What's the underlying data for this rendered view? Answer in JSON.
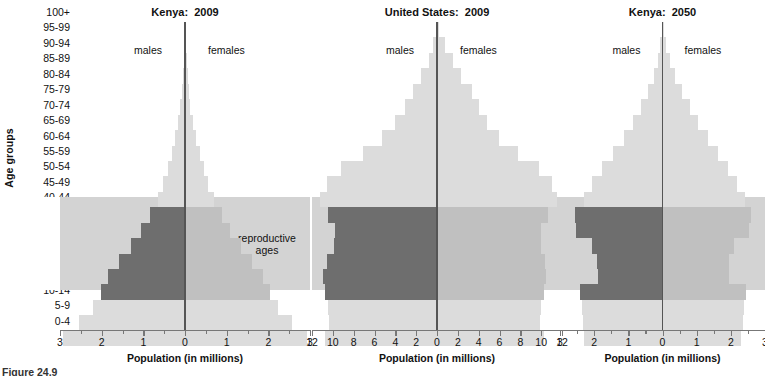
{
  "figure": {
    "caption": "Figure 24.9",
    "y_axis_title": "Age groups",
    "x_axis_title": "Population (in millions)",
    "reproductive_label_line1": "reproductive",
    "reproductive_label_line2": "ages",
    "male_label": "males",
    "female_label": "females",
    "band_color": "#d3d3d3",
    "bar_light_color": "#dcdcdc",
    "bar_mid_color": "#c0c0c0",
    "bar_dark_color": "#6e6e6e",
    "centerline_color": "#555555"
  },
  "age_groups": [
    "100+",
    "95-99",
    "90-94",
    "85-89",
    "80-84",
    "75-79",
    "70-74",
    "65-69",
    "60-64",
    "55-59",
    "50-54",
    "45-49",
    "40-44",
    "35-39",
    "30-34",
    "25-29",
    "20-24",
    "15-19",
    "10-14",
    "5-9",
    "0-4"
  ],
  "reproductive_ages": [
    "15-19",
    "20-24",
    "25-29",
    "30-34",
    "35-39",
    "40-44"
  ],
  "chart_data": [
    {
      "type": "bar",
      "title": "Kenya:  2009",
      "xlabel": "Population (in millions)",
      "ylabel": "Age groups",
      "xlim": [
        -3,
        3
      ],
      "xticks": [
        3,
        2,
        1,
        0,
        1,
        2,
        3
      ],
      "xtick_values": [
        -3,
        -2,
        -1,
        0,
        1,
        2,
        3
      ],
      "minor_tick_step": 0.5,
      "grid": false,
      "categories": [
        "100+",
        "95-99",
        "90-94",
        "85-89",
        "80-84",
        "75-79",
        "70-74",
        "65-69",
        "60-64",
        "55-59",
        "50-54",
        "45-49",
        "40-44",
        "35-39",
        "30-34",
        "25-29",
        "20-24",
        "15-19",
        "10-14",
        "5-9",
        "0-4"
      ],
      "series": [
        {
          "name": "males",
          "values": [
            0.01,
            0.02,
            0.03,
            0.05,
            0.08,
            0.12,
            0.17,
            0.24,
            0.32,
            0.41,
            0.52,
            0.66,
            0.84,
            1.05,
            1.3,
            1.58,
            1.85,
            2.02,
            2.22,
            2.55,
            2.92
          ]
        },
        {
          "name": "females",
          "values": [
            0.01,
            0.02,
            0.04,
            0.06,
            0.09,
            0.13,
            0.19,
            0.26,
            0.35,
            0.45,
            0.56,
            0.7,
            0.88,
            1.09,
            1.34,
            1.61,
            1.88,
            2.05,
            2.24,
            2.57,
            2.93
          ]
        }
      ]
    },
    {
      "type": "bar",
      "title": "United States:  2009",
      "xlabel": "Population (in millions)",
      "ylabel": "Age groups",
      "xlim": [
        -12,
        12
      ],
      "xticks": [
        12,
        10,
        8,
        6,
        4,
        2,
        0,
        2,
        4,
        6,
        8,
        10,
        12
      ],
      "xtick_values": [
        -12,
        -10,
        -8,
        -6,
        -4,
        -2,
        0,
        2,
        4,
        6,
        8,
        10,
        12
      ],
      "minor_tick_step": 2,
      "grid": false,
      "categories": [
        "100+",
        "95-99",
        "90-94",
        "85-89",
        "80-84",
        "75-79",
        "70-74",
        "65-69",
        "60-64",
        "55-59",
        "50-54",
        "45-49",
        "40-44",
        "35-39",
        "30-34",
        "25-29",
        "20-24",
        "15-19",
        "10-14",
        "5-9",
        "0-4"
      ],
      "series": [
        {
          "name": "males",
          "values": [
            0.05,
            0.35,
            0.8,
            1.55,
            2.35,
            3.1,
            4.0,
            5.25,
            7.1,
            9.2,
            10.55,
            11.25,
            10.45,
            9.8,
            9.9,
            10.55,
            10.9,
            10.75,
            10.45,
            10.35,
            10.75
          ]
        },
        {
          "name": "females",
          "values": [
            0.18,
            0.75,
            1.5,
            2.35,
            3.35,
            4.05,
            4.8,
            5.95,
            7.75,
            9.75,
            11.0,
            11.55,
            10.7,
            9.95,
            9.95,
            10.35,
            10.45,
            10.25,
            10.0,
            9.9,
            10.3
          ]
        }
      ]
    },
    {
      "type": "bar",
      "title": "Kenya:  2050",
      "xlabel": "Population (in millions)",
      "ylabel": "Age groups",
      "xlim": [
        -3,
        3
      ],
      "xticks": [
        3,
        2,
        1,
        0,
        1,
        2,
        3
      ],
      "xtick_values": [
        -3,
        -2,
        -1,
        0,
        1,
        2,
        3
      ],
      "minor_tick_step": 0.5,
      "grid": false,
      "categories": [
        "100+",
        "95-99",
        "90-94",
        "85-89",
        "80-84",
        "75-79",
        "70-74",
        "65-69",
        "60-64",
        "55-59",
        "50-54",
        "45-49",
        "40-44",
        "35-39",
        "30-34",
        "25-29",
        "20-24",
        "15-19",
        "10-14",
        "5-9",
        "0-4"
      ],
      "series": [
        {
          "name": "males",
          "values": [
            0.02,
            0.06,
            0.14,
            0.26,
            0.42,
            0.62,
            0.86,
            1.14,
            1.44,
            1.76,
            2.05,
            2.3,
            2.56,
            2.52,
            2.06,
            1.92,
            1.9,
            2.42,
            2.36,
            2.34,
            2.3
          ]
        },
        {
          "name": "females",
          "values": [
            0.04,
            0.11,
            0.22,
            0.38,
            0.58,
            0.8,
            1.05,
            1.33,
            1.62,
            1.92,
            2.18,
            2.4,
            2.6,
            2.54,
            2.1,
            1.96,
            1.94,
            2.44,
            2.38,
            2.35,
            2.31
          ]
        }
      ]
    }
  ]
}
